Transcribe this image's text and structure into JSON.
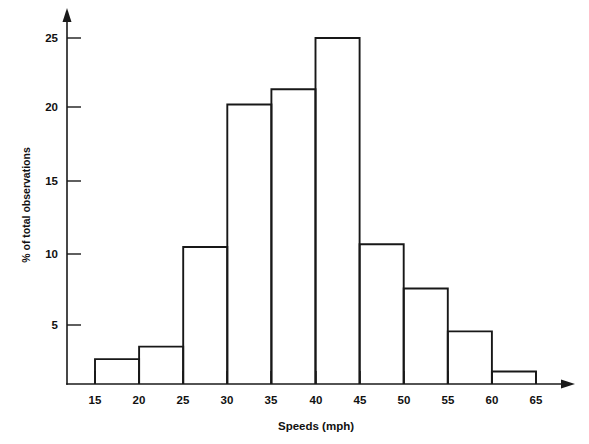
{
  "chart_data": {
    "type": "bar",
    "title": "",
    "subtitle": "",
    "xlabel": "Speeds (mph)",
    "ylabel": "% of total observations",
    "bin_edges": [
      15,
      20,
      25,
      30,
      35,
      40,
      45,
      50,
      55,
      60,
      65
    ],
    "categories": [
      "15-20",
      "20-25",
      "25-30",
      "30-35",
      "35-40",
      "40-45",
      "45-50",
      "50-55",
      "55-60",
      "60-65"
    ],
    "values": [
      1.8,
      2.7,
      9.9,
      20.2,
      21.3,
      25.0,
      10.1,
      6.9,
      3.8,
      0.9
    ],
    "xticks": [
      15,
      20,
      25,
      30,
      35,
      40,
      45,
      50,
      55,
      60,
      65
    ],
    "xtick_labels": [
      "15",
      "20",
      "25",
      "30",
      "35",
      "40",
      "45",
      "50",
      "55",
      "60",
      "65"
    ],
    "yticks": [
      5,
      10,
      15,
      20,
      25
    ],
    "ytick_labels": [
      "5",
      "10",
      "15",
      "20",
      "25"
    ],
    "xlim": [
      15,
      65
    ],
    "ylim": [
      0,
      27
    ],
    "grid": false,
    "legend": false,
    "legend_position": "none",
    "bar_style": "outline",
    "bar_fill_color": "#ffffff",
    "bar_line_color": "#181818",
    "axis_color": "#1a1a1a",
    "background_color": "#ffffff",
    "axis_arrows": {
      "y_axis_arrow": "up-arrow-icon",
      "x_axis_arrow": "right-arrow-icon"
    }
  }
}
